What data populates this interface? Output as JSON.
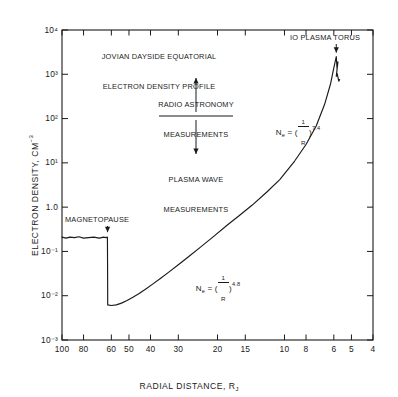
{
  "figure": {
    "title_line1": "JOVIAN DAYSIDE EQUATORIAL",
    "title_line2": "ELECTRON DENSITY PROFILE",
    "background": "#ffffff",
    "ink": "#1a1a1a"
  },
  "annotations": {
    "magnetopause": "MAGNETOPAUSE",
    "io_torus": "IO PLASMA TORUS",
    "radio_line1": "RADIO ASTRONOMY",
    "radio_line2": "MEASUREMENTS",
    "plasma_line1": "PLASMA WAVE",
    "plasma_line2": "MEASUREMENTS",
    "fit_inner": {
      "lhs": "N",
      "sub": "e",
      "eq": " = (",
      "frac_num": "1",
      "frac_den": "R",
      "close": ")",
      "exp": "7.4"
    },
    "fit_outer": {
      "lhs": "N",
      "sub": "e",
      "eq": " = (",
      "frac_num": "1",
      "frac_den": "R",
      "close": ")",
      "exp": "4.8"
    }
  },
  "chart_data": {
    "type": "line",
    "title": "JOVIAN DAYSIDE EQUATORIAL ELECTRON DENSITY PROFILE",
    "xlabel": "RADIAL DISTANCE, R_J",
    "ylabel": "ELECTRON DENSITY, CM^-3",
    "xscale": "log",
    "yscale": "log",
    "x_reversed": true,
    "xlim": [
      100,
      4
    ],
    "ylim": [
      0.001,
      10000
    ],
    "grid": false,
    "legend": null,
    "xticks": [
      100,
      80,
      60,
      50,
      40,
      30,
      20,
      15,
      10,
      8,
      6,
      5,
      4
    ],
    "xtick_labels": [
      "100",
      "80",
      "60",
      "50",
      "40",
      "30",
      "20",
      "15",
      "10",
      "8",
      "6",
      "5",
      "4"
    ],
    "yticks": [
      0.001,
      0.01,
      0.1,
      1,
      10,
      100,
      1000,
      10000
    ],
    "ytick_labels": [
      "10⁻³",
      "10⁻²",
      "10⁻¹",
      "1.0",
      "10¹",
      "10²",
      "10³",
      "10⁴"
    ],
    "series": [
      {
        "name": "Electron density",
        "x": [
          100,
          96,
          92,
          88,
          84,
          80,
          76,
          72,
          68,
          65,
          63.5,
          62.5,
          62.4,
          62.3,
          60,
          57,
          54,
          51,
          48,
          45,
          42,
          39,
          36,
          33,
          30,
          27,
          24,
          21,
          18,
          16,
          14,
          12,
          10.5,
          9,
          8,
          7.2,
          6.6,
          6.2,
          6.0,
          5.85,
          5.8,
          5.75,
          5.85,
          5.8,
          5.7,
          5.65
        ],
        "y": [
          0.21,
          0.2,
          0.21,
          0.205,
          0.215,
          0.2,
          0.205,
          0.21,
          0.2,
          0.21,
          0.205,
          0.21,
          0.05,
          0.0062,
          0.006,
          0.0062,
          0.0068,
          0.0078,
          0.0092,
          0.0112,
          0.0142,
          0.0185,
          0.0248,
          0.0345,
          0.05,
          0.076,
          0.122,
          0.21,
          0.4,
          0.64,
          1.1,
          2.2,
          4.2,
          11,
          26,
          68,
          210,
          620,
          1400,
          2500,
          1300,
          1900,
          900,
          1050,
          700,
          760
        ],
        "note": "Noisy solar-wind plateau, magnetopause step-down, inner magnetosphere rise to the Io plasma torus peak with post-peak fine structure"
      }
    ],
    "markers": [
      {
        "label": "MAGNETOPAUSE",
        "x": 62.4,
        "y": 0.21
      },
      {
        "label": "IO PLASMA TORUS",
        "x": 5.85,
        "y": 2500
      }
    ],
    "annotations_math": [
      {
        "text": "Ne = (1/R)^7.4",
        "x": 9.5,
        "y": 60
      },
      {
        "text": "Ne = (1/R)^4.8",
        "x": 26,
        "y": 0.09
      }
    ]
  },
  "axis_titles": {
    "x": "RADIAL DISTANCE, R",
    "x_sub": "J",
    "y_main": "ELECTRON DENSITY, CM",
    "y_exp": "-3"
  }
}
